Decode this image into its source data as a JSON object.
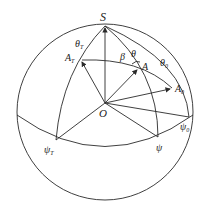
{
  "diagram": {
    "type": "spherical-geometry",
    "colors": {
      "stroke": "#2a2a2a",
      "background": "#ffffff"
    },
    "labels": {
      "S": "S",
      "O": "O",
      "theta_T": "θ",
      "theta_T_sub": "T",
      "A_T": "A",
      "A_T_sub": "T",
      "beta": "β",
      "theta": "θ",
      "A": "A",
      "theta_0": "θ",
      "theta_0_sub": "0",
      "A_0": "A",
      "A_0_sub": "0",
      "psi_T": "ψ",
      "psi_T_sub": "T",
      "psi": "ψ",
      "psi_0": "ψ",
      "psi_0_sub": "0"
    }
  }
}
